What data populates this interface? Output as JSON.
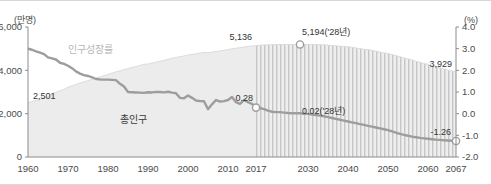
{
  "chart_data": {
    "type": "line",
    "title": "",
    "subtitle": "",
    "xlabel": "",
    "ylabel_left": "(만명)",
    "ylabel_right": "(%)",
    "x": [
      1960,
      1961,
      1962,
      1963,
      1964,
      1965,
      1966,
      1967,
      1968,
      1969,
      1970,
      1971,
      1972,
      1973,
      1974,
      1975,
      1976,
      1977,
      1978,
      1979,
      1980,
      1981,
      1982,
      1983,
      1984,
      1985,
      1986,
      1987,
      1988,
      1989,
      1990,
      1991,
      1992,
      1993,
      1994,
      1995,
      1996,
      1997,
      1998,
      1999,
      2000,
      2001,
      2002,
      2003,
      2004,
      2005,
      2006,
      2007,
      2008,
      2009,
      2010,
      2011,
      2012,
      2013,
      2014,
      2015,
      2016,
      2017,
      2018,
      2019,
      2020,
      2021,
      2022,
      2023,
      2024,
      2025,
      2026,
      2027,
      2028,
      2029,
      2030,
      2031,
      2032,
      2033,
      2034,
      2035,
      2036,
      2037,
      2038,
      2039,
      2040,
      2041,
      2042,
      2043,
      2044,
      2045,
      2046,
      2047,
      2048,
      2049,
      2050,
      2051,
      2052,
      2053,
      2054,
      2055,
      2056,
      2057,
      2058,
      2059,
      2060,
      2061,
      2062,
      2063,
      2064,
      2065,
      2066,
      2067
    ],
    "xlim": [
      1960,
      2067
    ],
    "x_ticks": [
      "1960",
      "1970",
      "1980",
      "1990",
      "2000",
      "2010",
      "2017",
      "2030",
      "2040",
      "2050",
      "2060",
      "2067"
    ],
    "x_tick_values": [
      1960,
      1970,
      1980,
      1990,
      2000,
      2010,
      2017,
      2030,
      2040,
      2050,
      2060,
      2067
    ],
    "ylim_left": [
      0,
      6000
    ],
    "y_ticks_left": [
      "0",
      "2,000",
      "4,000",
      "6,000"
    ],
    "y_tick_values_left": [
      0,
      2000,
      4000,
      6000
    ],
    "ylim_right": [
      -2.0,
      4.0
    ],
    "y_ticks_right": [
      "-2.0",
      "-1.0",
      "0.0",
      "1.0",
      "2.0",
      "3.0",
      "4.0"
    ],
    "y_tick_values_right": [
      -2.0,
      -1.0,
      0.0,
      1.0,
      2.0,
      3.0,
      4.0
    ],
    "grid": false,
    "legend_position": "inline-annotation",
    "forecast_start_year": 2017,
    "series": [
      {
        "name": "총인구",
        "kind": "area",
        "axis": "left",
        "unit": "만명",
        "color": "#ececec",
        "values": [
          2501,
          2556,
          2614,
          2672,
          2727,
          2778,
          2916,
          2989,
          3054,
          3122,
          3224,
          3288,
          3350,
          3410,
          3469,
          3528,
          3584,
          3641,
          3697,
          3753,
          3812,
          3872,
          3928,
          3981,
          4031,
          4081,
          4129,
          4177,
          4228,
          4283,
          4287,
          4330,
          4375,
          4419,
          4462,
          4509,
          4553,
          4595,
          4629,
          4662,
          4701,
          4735,
          4764,
          4792,
          4820,
          4814,
          4837,
          4868,
          4895,
          4924,
          4955,
          4994,
          5020,
          5043,
          5075,
          5101,
          5125,
          5136,
          5160,
          5171,
          5178,
          5182,
          5186,
          5190,
          5192,
          5193,
          5194,
          5194,
          5194,
          5193,
          5193,
          5191,
          5188,
          5183,
          5177,
          5163,
          5148,
          5132,
          5113,
          5092,
          5086,
          5060,
          5032,
          5002,
          4970,
          4957,
          4920,
          4882,
          4842,
          4800,
          4774,
          4726,
          4677,
          4627,
          4575,
          4528,
          4474,
          4420,
          4365,
          4309,
          4284,
          4228,
          4173,
          4118,
          4064,
          4010,
          3969,
          3929
        ],
        "start_label": "2,501",
        "peak_label": "5,194('28년)",
        "peak_value": 5194,
        "peak_year": 2028,
        "boundary_label": "5,136",
        "boundary_value": 5136,
        "boundary_year": 2017,
        "end_label": "3,929",
        "end_value": 3929,
        "end_year": 2067
      },
      {
        "name": "인구성장률",
        "kind": "line",
        "axis": "right",
        "unit": "%",
        "color": "#9d9d9d",
        "values": [
          3.0,
          2.95,
          2.88,
          2.82,
          2.75,
          2.6,
          2.55,
          2.5,
          2.35,
          2.3,
          2.21,
          2.1,
          1.95,
          1.85,
          1.78,
          1.74,
          1.68,
          1.6,
          1.58,
          1.57,
          1.57,
          1.56,
          1.55,
          1.38,
          1.25,
          1.0,
          0.99,
          0.98,
          0.97,
          0.96,
          0.99,
          0.98,
          1.0,
          1.0,
          0.98,
          1.01,
          0.97,
          0.94,
          0.73,
          0.71,
          0.84,
          0.73,
          0.61,
          0.58,
          0.57,
          0.21,
          0.43,
          0.63,
          0.56,
          0.58,
          0.63,
          0.77,
          0.53,
          0.45,
          0.63,
          0.53,
          0.45,
          0.28,
          0.26,
          0.21,
          0.14,
          0.09,
          0.07,
          0.07,
          0.05,
          0.03,
          0.02,
          0.02,
          0.02,
          -0.01,
          -0.01,
          -0.04,
          -0.06,
          -0.09,
          -0.12,
          -0.16,
          -0.2,
          -0.24,
          -0.28,
          -0.32,
          -0.36,
          -0.4,
          -0.44,
          -0.48,
          -0.52,
          -0.56,
          -0.6,
          -0.64,
          -0.68,
          -0.72,
          -0.76,
          -0.82,
          -0.88,
          -0.93,
          -0.98,
          -1.02,
          -1.06,
          -1.09,
          -1.12,
          -1.14,
          -1.16,
          -1.18,
          -1.2,
          -1.21,
          -1.23,
          -1.24,
          -1.25,
          -1.26
        ],
        "boundary_label": "0.28",
        "boundary_value": 0.28,
        "boundary_year": 2017,
        "mid_label": "0.02('28년)",
        "mid_value": 0.02,
        "mid_year": 2028,
        "end_label": "-1.26",
        "end_value": -1.26,
        "end_year": 2067
      }
    ],
    "annotations": [
      {
        "id": "pop-start",
        "text": "2,501"
      },
      {
        "id": "pop-boundary",
        "text": "5,136"
      },
      {
        "id": "pop-peak",
        "text": "5,194('28년)"
      },
      {
        "id": "pop-end",
        "text": "3,929"
      },
      {
        "id": "growth-boundary",
        "text": "0.28"
      },
      {
        "id": "growth-mid",
        "text": "0.02('28년)"
      },
      {
        "id": "growth-end",
        "text": "-1.26"
      },
      {
        "id": "label-total-population",
        "text": "총인구"
      },
      {
        "id": "label-growth-rate",
        "text": "인구성장률"
      }
    ],
    "colors": {
      "area_fill": "#ececec",
      "forecast_hatch": "#c9c9c9",
      "line": "#9d9d9d",
      "axis": "#8c8c8c",
      "text": "#3a3a3a",
      "faint_text": "#b6b6b6"
    }
  }
}
